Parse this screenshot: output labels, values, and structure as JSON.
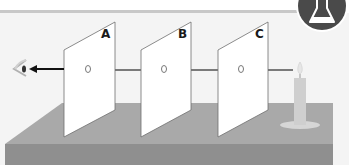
{
  "figure": {
    "badge": {
      "icon": "flask-icon",
      "color": "#4a4a4a"
    },
    "panels": [
      {
        "label": "A",
        "hole": true
      },
      {
        "label": "B",
        "hole": true
      },
      {
        "label": "C",
        "hole": true
      }
    ],
    "light_source": "candle",
    "observer": "eye",
    "colors": {
      "background": "#f4f4f4",
      "header_rule": "#c8c8c8",
      "table_top": "#a9a9a9",
      "table_front": "#8f8f8f",
      "panel_fill": "#ffffff",
      "panel_stroke": "#6e6e6e",
      "light_ray": "#7a7a7a",
      "output_ray": "#111111",
      "candle": "#d0d0d0",
      "flame": "#e8e8e8"
    }
  }
}
